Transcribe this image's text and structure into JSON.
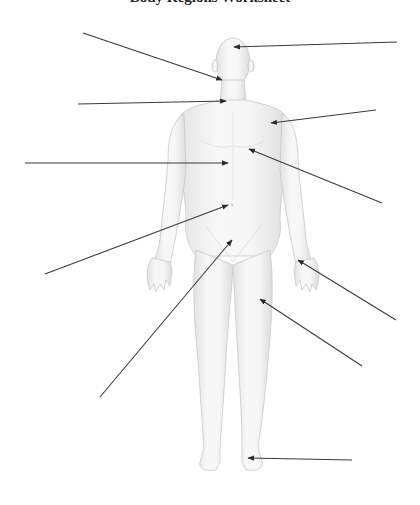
{
  "title": "Body Regions Worksheet",
  "figure": {
    "colors": {
      "skin_light": "#f7f7f7",
      "skin_shade": "#dedede",
      "outline": "#c8c8c8",
      "leader": "#3a3a3a",
      "background": "#ffffff"
    }
  },
  "labels": [
    {
      "id": "cephalic",
      "text": "",
      "side": "right",
      "from": [
        397,
        42
      ],
      "to": [
        234,
        47
      ]
    },
    {
      "id": "oral-buccal",
      "text": "",
      "side": "left",
      "from": [
        83,
        33
      ],
      "to": [
        222,
        80
      ]
    },
    {
      "id": "cervical",
      "text": "",
      "side": "left",
      "from": [
        78,
        104
      ],
      "to": [
        226,
        101
      ]
    },
    {
      "id": "acromial",
      "text": "",
      "side": "right",
      "from": [
        376,
        110
      ],
      "to": [
        271,
        123
      ]
    },
    {
      "id": "sternal",
      "text": "",
      "side": "left",
      "from": [
        25,
        163
      ],
      "to": [
        228,
        163
      ]
    },
    {
      "id": "pectoral",
      "text": "",
      "side": "right",
      "from": [
        382,
        203
      ],
      "to": [
        249,
        149
      ]
    },
    {
      "id": "umbilical",
      "text": "",
      "side": "left",
      "from": [
        45,
        274
      ],
      "to": [
        228,
        205
      ]
    },
    {
      "id": "pubic",
      "text": "",
      "side": "left",
      "from": [
        100,
        397
      ],
      "to": [
        232,
        240
      ]
    },
    {
      "id": "palmar",
      "text": "",
      "side": "right",
      "from": [
        396,
        320
      ],
      "to": [
        298,
        260
      ]
    },
    {
      "id": "femoral",
      "text": "",
      "side": "right",
      "from": [
        362,
        366
      ],
      "to": [
        260,
        299
      ]
    },
    {
      "id": "tarsal",
      "text": "",
      "side": "right",
      "from": [
        352,
        460
      ],
      "to": [
        248,
        458
      ]
    }
  ]
}
